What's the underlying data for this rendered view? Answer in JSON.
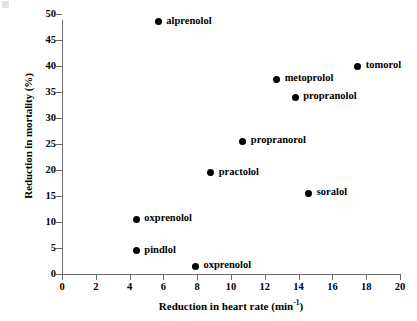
{
  "chart_data": {
    "type": "scatter",
    "title": "",
    "xlabel": "Reduction in heart rate (min",
    "xlabel_sup": "-1",
    "xlabel_tail": ")",
    "ylabel": "Reduction in mortality (%)",
    "xlim": [
      0,
      20
    ],
    "ylim": [
      0,
      52
    ],
    "xticks": [
      0,
      2,
      4,
      6,
      8,
      10,
      12,
      14,
      16,
      18,
      20
    ],
    "yticks": [
      0,
      5,
      10,
      15,
      20,
      25,
      30,
      35,
      40,
      45,
      50
    ],
    "xtick_labels": [
      "0",
      "2",
      "4",
      "6",
      "8",
      "10",
      "12",
      "14",
      "16",
      "18",
      "20"
    ],
    "ytick_labels": [
      "0",
      "5",
      "10",
      "15",
      "20",
      "25",
      "30",
      "35",
      "40",
      "45",
      "50"
    ],
    "grid": false,
    "legend": "none",
    "marker_color": "#000000",
    "axis_color": "#6b6b6b",
    "points": [
      {
        "label": "alprenolol",
        "x": 5.7,
        "y": 48.5
      },
      {
        "label": "tomorol",
        "x": 17.5,
        "y": 40.0
      },
      {
        "label": "metoprolol",
        "x": 12.7,
        "y": 37.5
      },
      {
        "label": "propranolol",
        "x": 13.8,
        "y": 34.0
      },
      {
        "label": "propranorol",
        "x": 10.7,
        "y": 25.5
      },
      {
        "label": "practolol",
        "x": 8.8,
        "y": 19.5
      },
      {
        "label": "soralol",
        "x": 14.6,
        "y": 15.5
      },
      {
        "label": "oxprenolol",
        "x": 4.4,
        "y": 10.5
      },
      {
        "label": "pindlol",
        "x": 4.4,
        "y": 4.5
      },
      {
        "label": "oxprenolol",
        "x": 7.9,
        "y": 1.5
      }
    ]
  }
}
